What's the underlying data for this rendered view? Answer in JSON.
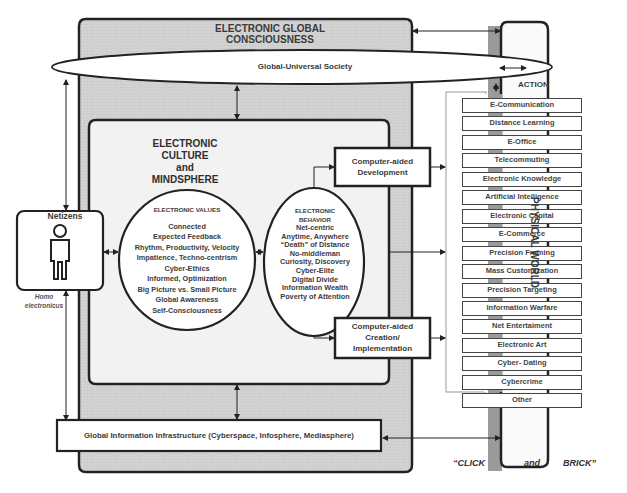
{
  "diagram": {
    "outer_title": "ELECTRONIC GLOBAL CONSCIOUSNESS",
    "society": "Global-Universal Society",
    "action_label": "ACTION",
    "culture_title": [
      "ELECTRONIC",
      "CULTURE",
      "and",
      "MINDSPHERE"
    ],
    "netizens": {
      "label": "Netizens",
      "caption_line1": "Homo",
      "caption_line2": "electronicus"
    },
    "values": {
      "title": "ELECTRONIC  VALUES",
      "items": [
        "Connected",
        "Expected Feedback",
        "Rhythm, Productivity, Velocity",
        "Impatience,  Techno-centrism",
        "Cyber-Ethics",
        "Informed, Optimization",
        "Big Picture vs. Small Picture",
        "Global Awareness",
        "Self-Consciousness"
      ]
    },
    "behavior": {
      "title_line1": "ELECTRONIC",
      "title_line2": "BEHAVIOR",
      "items": [
        "Net-centric",
        "Anytime, Anywhere",
        "“Death” of Distance",
        "No-middleman",
        "Curiosity, Discovery",
        "Cyber-Elite",
        "Digital Divide",
        "Information Wealth",
        "Poverty of Attention"
      ]
    },
    "cad_development": [
      "Computer-aided",
      "Development"
    ],
    "cad_creation": [
      "Computer-aided",
      "Creation/",
      "Implementation"
    ],
    "actions": [
      "E-Communication",
      "Distance Learning",
      "E-Office",
      "Telecommuting",
      "Electronic  Knowledge",
      "Artificial Intelligence",
      "Electronic Capital",
      "E-Commerce",
      "Precision Framing",
      "Mass Customization",
      "Precision Targeting",
      "Information Warfare",
      "Net Entertaiment",
      "Electronic Art",
      "Cyber- Dating",
      "Cybercrime",
      "Other"
    ],
    "physical_world": "PHYSICAL WORLD",
    "infrastructure": "Global Information Infrastructure (Cyberspace, Infosphere, Mediasphere)",
    "click": "“CLICK",
    "and": "and",
    "brick": "BRICK”"
  }
}
